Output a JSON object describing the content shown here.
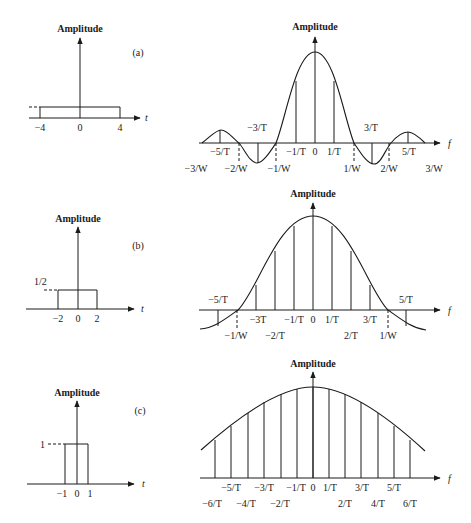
{
  "header": {
    "text": ""
  },
  "panels": [
    {
      "id": "a",
      "tag": "(a)",
      "time": {
        "ylabel": "Amplitude",
        "xlabel": "t",
        "ticks": [
          "−4",
          "0",
          "4"
        ],
        "pulse": {
          "from": -4,
          "to": 4,
          "height_label": ""
        }
      },
      "freq": {
        "ylabel": "Amplitude",
        "xlabel": "f",
        "labels_top": [
          "−3/T",
          "3/T"
        ],
        "labels_mid": [
          "−5/T",
          "−1/T",
          "0",
          "1/T",
          "5/T"
        ],
        "labels_bottom": [
          "−3/W",
          "−2/W",
          "−1/W",
          "1/W",
          "2/W",
          "3/W"
        ]
      }
    },
    {
      "id": "b",
      "tag": "(b)",
      "time": {
        "ylabel": "Amplitude",
        "xlabel": "t",
        "ticks": [
          "−2",
          "0",
          "2"
        ],
        "pulse": {
          "from": -2,
          "to": 2,
          "height_label": "1/2"
        }
      },
      "freq": {
        "ylabel": "Amplitude",
        "xlabel": "f",
        "labels_top": [
          "−5/T",
          "5/T"
        ],
        "labels_mid": [
          "−3T",
          "−1/T",
          "0",
          "1/T",
          "3/T"
        ],
        "labels_bottom": [
          "−1/W",
          "−2/T",
          "2/T",
          "1/W"
        ]
      }
    },
    {
      "id": "c",
      "tag": "(c)",
      "time": {
        "ylabel": "Amplitude",
        "xlabel": "t",
        "ticks": [
          "−1",
          "0",
          "1"
        ],
        "pulse": {
          "from": -1,
          "to": 1,
          "height_label": "1"
        }
      },
      "freq": {
        "ylabel": "Amplitude",
        "xlabel": "f",
        "labels_mid": [
          "−5/T",
          "−3/T",
          "−1/T",
          "0",
          "1/T",
          "3/T",
          "5/T"
        ],
        "labels_bottom": [
          "−6/T",
          "−4/T",
          "−2/T",
          "2/T",
          "4/T",
          "6/T"
        ]
      }
    }
  ]
}
